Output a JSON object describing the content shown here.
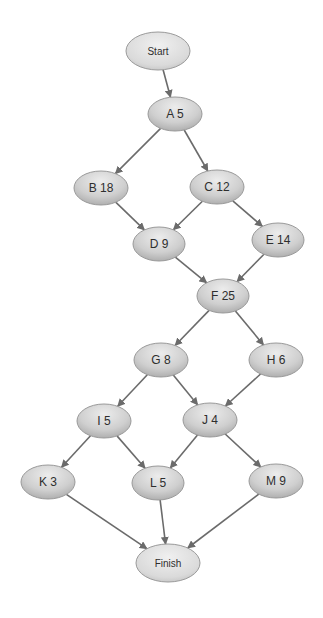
{
  "diagram": {
    "type": "network-activity-diagram",
    "colors": {
      "node_fill_light": "#e6e6e6",
      "node_fill_dark": "#a9a9a9",
      "node_stroke": "#9a9a9a",
      "edge": "#6b6b6b",
      "text": "#2e2e2e"
    },
    "nodes": [
      {
        "id": "start",
        "label": "Start",
        "cx": 158,
        "cy": 51,
        "rx": 32,
        "ry": 19,
        "terminal": true
      },
      {
        "id": "A",
        "label": "A 5",
        "cx": 175,
        "cy": 114,
        "rx": 27,
        "ry": 17
      },
      {
        "id": "B",
        "label": "B 18",
        "cx": 101,
        "cy": 188,
        "rx": 27,
        "ry": 17
      },
      {
        "id": "C",
        "label": "C 12",
        "cx": 217,
        "cy": 187,
        "rx": 27,
        "ry": 17
      },
      {
        "id": "D",
        "label": "D 9",
        "cx": 159,
        "cy": 244,
        "rx": 26,
        "ry": 17
      },
      {
        "id": "E",
        "label": "E 14",
        "cx": 278,
        "cy": 240,
        "rx": 26,
        "ry": 17
      },
      {
        "id": "F",
        "label": "F 25",
        "cx": 223,
        "cy": 296,
        "rx": 26,
        "ry": 17
      },
      {
        "id": "G",
        "label": "G 8",
        "cx": 161,
        "cy": 360,
        "rx": 27,
        "ry": 17
      },
      {
        "id": "H",
        "label": "H 6",
        "cx": 276,
        "cy": 360,
        "rx": 27,
        "ry": 17
      },
      {
        "id": "I",
        "label": "I 5",
        "cx": 104,
        "cy": 421,
        "rx": 27,
        "ry": 17
      },
      {
        "id": "J",
        "label": "J 4",
        "cx": 210,
        "cy": 420,
        "rx": 27,
        "ry": 17
      },
      {
        "id": "K",
        "label": "K 3",
        "cx": 48,
        "cy": 482,
        "rx": 27,
        "ry": 17
      },
      {
        "id": "L",
        "label": "L 5",
        "cx": 158,
        "cy": 483,
        "rx": 26,
        "ry": 17
      },
      {
        "id": "M",
        "label": "M 9",
        "cx": 276,
        "cy": 481,
        "rx": 27,
        "ry": 17
      },
      {
        "id": "finish",
        "label": "Finish",
        "cx": 168,
        "cy": 563,
        "rx": 32,
        "ry": 19,
        "terminal": true
      }
    ],
    "edges": [
      {
        "from": "start",
        "to": "A"
      },
      {
        "from": "A",
        "to": "B"
      },
      {
        "from": "A",
        "to": "C"
      },
      {
        "from": "B",
        "to": "D"
      },
      {
        "from": "C",
        "to": "D"
      },
      {
        "from": "C",
        "to": "E"
      },
      {
        "from": "D",
        "to": "F"
      },
      {
        "from": "E",
        "to": "F"
      },
      {
        "from": "F",
        "to": "G"
      },
      {
        "from": "F",
        "to": "H"
      },
      {
        "from": "G",
        "to": "I"
      },
      {
        "from": "G",
        "to": "J"
      },
      {
        "from": "H",
        "to": "J"
      },
      {
        "from": "I",
        "to": "K"
      },
      {
        "from": "I",
        "to": "L"
      },
      {
        "from": "J",
        "to": "L"
      },
      {
        "from": "J",
        "to": "M"
      },
      {
        "from": "K",
        "to": "finish"
      },
      {
        "from": "L",
        "to": "finish"
      },
      {
        "from": "M",
        "to": "finish"
      }
    ]
  }
}
